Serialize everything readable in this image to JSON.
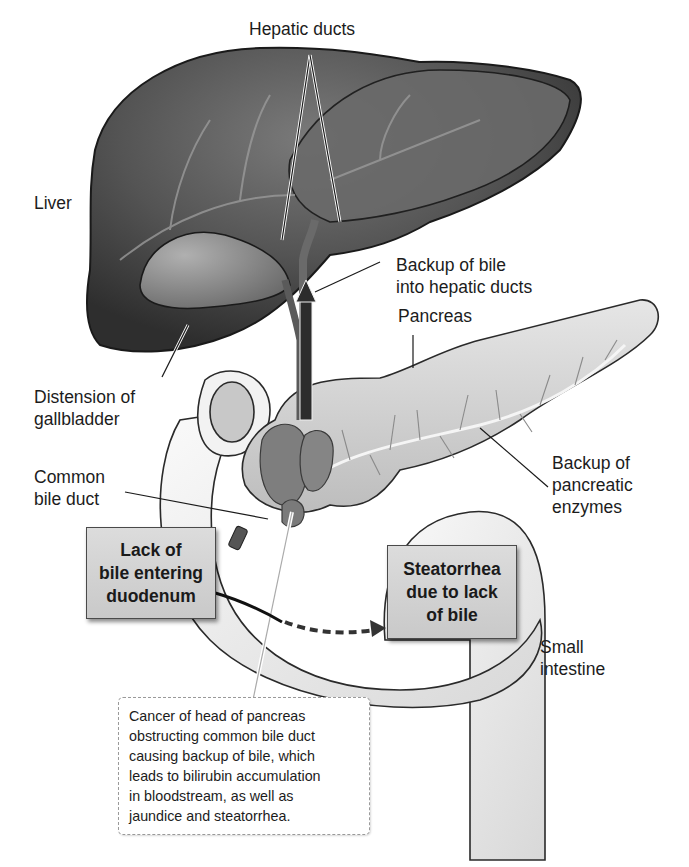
{
  "figure": {
    "colors": {
      "liver": "#4a4a4a",
      "liver_highlight": "#707070",
      "gallbladder": "#8a8a8a",
      "pancreas": "#d4d4d4",
      "tumor": "#7e7e7e",
      "intestine": "#efefef",
      "callout_bg": "#d2d2d2",
      "leader_line": "#1a1a1a"
    }
  },
  "labels": {
    "hepatic_ducts": "Hepatic ducts",
    "liver": "Liver",
    "backup_bile": [
      "Backup of bile",
      "into hepatic ducts"
    ],
    "pancreas": "Pancreas",
    "distension": [
      "Distension of",
      "gallbladder"
    ],
    "common_bile_duct": [
      "Common",
      "bile duct"
    ],
    "backup_enzymes": [
      "Backup of",
      "pancreatic",
      "enzymes"
    ],
    "small_intestine": [
      "Small",
      "intestine"
    ]
  },
  "callouts": {
    "lack_of_bile": [
      "Lack of",
      "bile entering",
      "duodenum"
    ],
    "steatorrhea": [
      "Steatorrhea",
      "due to lack",
      "of bile"
    ]
  },
  "caption": {
    "lines": [
      "Cancer of head of pancreas",
      "obstructing common bile duct",
      "causing backup of bile, which",
      "leads to bilirubin accumulation",
      "in bloodstream, as well as",
      "jaundice and steatorrhea."
    ]
  }
}
